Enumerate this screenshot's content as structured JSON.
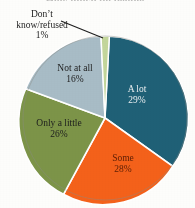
{
  "title_remnant": "How much do people...",
  "colors": {
    "a_lot": "#1F6076",
    "some": "#F4611A",
    "only_a_little": "#7C9448",
    "not_at_all": "#A8BCC6",
    "dont_know": "#C3D69B",
    "slice_border": "#FFFFFF",
    "background": "#FDFDFB"
  },
  "labels": {
    "a_lot": {
      "name": "A lot",
      "pct": "29%"
    },
    "some": {
      "name": "Some",
      "pct": "28%"
    },
    "only_a_little": {
      "name": "Only a little",
      "pct": "26%"
    },
    "not_at_all": {
      "name": "Not at all",
      "pct": "16%"
    },
    "dont_know": {
      "name": "Don’t know/refused",
      "pct": "1%"
    }
  },
  "chart_data": {
    "type": "pie",
    "title": "",
    "xlabel": "",
    "ylabel": "",
    "legend": "none",
    "labels_position": "inside-slices-with-leader-for-smallest",
    "start_angle_deg": 3,
    "direction": "clockwise",
    "categories": [
      "A lot",
      "Some",
      "Only a little",
      "Not at all",
      "Don’t know/refused"
    ],
    "values": [
      29,
      28,
      26,
      16,
      1
    ],
    "value_unit": "percent",
    "slice_colors": [
      "#1F6076",
      "#F4611A",
      "#7C9448",
      "#A8BCC6",
      "#C3D69B"
    ],
    "annotations": [
      {
        "text": "Don’t know/refused 1%",
        "kind": "leader-line-callout",
        "points_to": "Don’t know/refused"
      }
    ]
  }
}
